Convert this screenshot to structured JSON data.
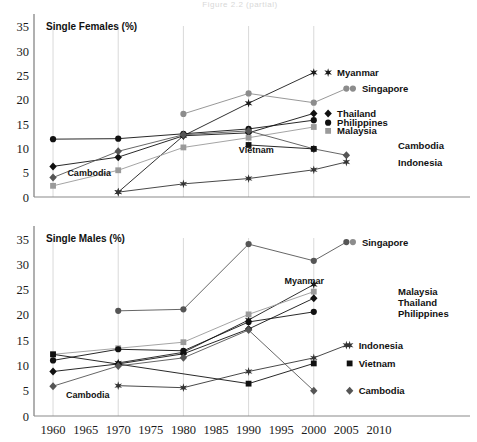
{
  "figure": {
    "faint_header": "Figure 2.2 (partial)",
    "background": "#ffffff",
    "ink": "#111111"
  },
  "panels": [
    {
      "id": "females",
      "title": "Single Females (%)"
    },
    {
      "id": "males",
      "title": "Single Males (%)"
    }
  ],
  "axis": {
    "x_ticks": [
      "1960",
      "1965",
      "1970",
      "1975",
      "1980",
      "1985",
      "1990",
      "1995",
      "2000",
      "2005",
      "2010"
    ],
    "y_ticks": [
      "0",
      "5",
      "10",
      "15",
      "20",
      "25",
      "30",
      "35"
    ],
    "xlim": [
      1958,
      2012
    ],
    "ylim": [
      0,
      36
    ],
    "grid": "vertical gridlines at 1960,1970,1980,1990,2000"
  },
  "inner_annotations": {
    "females": [
      {
        "text": "Cambodia",
        "x": 1962.2,
        "y": 4.3
      },
      {
        "text": "Vietnam",
        "x": 1988.5,
        "y": 9.0
      }
    ],
    "males": [
      {
        "text": "Cambodia",
        "x": 1962.0,
        "y": 3.6
      },
      {
        "text": "Myanmar",
        "x": 1995.5,
        "y": 26.2
      }
    ]
  },
  "series_colors": {
    "Myanmar": "#1a1a1a",
    "Singapore": "#8c8c8c",
    "Thailand": "#111111",
    "Philippines": "#111111",
    "Malaysia": "#9a9a9a",
    "Cambodia": "#555555",
    "Indonesia": "#333333",
    "Vietnam": "#111111"
  },
  "chart_data": [
    {
      "type": "line",
      "title": "Single Females (%)",
      "xlabel": "",
      "ylabel": "Single Females (%)",
      "xlim": [
        1958,
        2012
      ],
      "ylim": [
        0,
        36
      ],
      "x": [
        1960,
        1970,
        1980,
        1990,
        2000,
        2005
      ],
      "grid": "vertical only",
      "legend": "right-side series labels",
      "series": [
        {
          "name": "Myanmar",
          "marker": "star",
          "color": "#1a1a1a",
          "points": [
            [
              1970,
              1.0
            ],
            [
              1980,
              12.6
            ],
            [
              1990,
              19.3
            ],
            [
              2000,
              25.6
            ]
          ]
        },
        {
          "name": "Singapore",
          "marker": "circle",
          "color": "#8c8c8c",
          "points": [
            [
              1980,
              17.1
            ],
            [
              1990,
              21.3
            ],
            [
              2000,
              19.4
            ],
            [
              2005,
              22.3
            ]
          ]
        },
        {
          "name": "Thailand",
          "marker": "diamond",
          "color": "#111111",
          "points": [
            [
              1960,
              6.3
            ],
            [
              1970,
              8.2
            ],
            [
              1980,
              12.6
            ],
            [
              1990,
              13.2
            ],
            [
              2000,
              17.2
            ]
          ]
        },
        {
          "name": "Philippines",
          "marker": "circle",
          "color": "#111111",
          "points": [
            [
              1960,
              11.9
            ],
            [
              1970,
              12.0
            ],
            [
              1980,
              13.0
            ],
            [
              1990,
              14.0
            ],
            [
              2000,
              15.8
            ]
          ]
        },
        {
          "name": "Malaysia",
          "marker": "square",
          "color": "#9a9a9a",
          "points": [
            [
              1960,
              2.3
            ],
            [
              1970,
              5.5
            ],
            [
              1980,
              10.2
            ],
            [
              1990,
              12.2
            ],
            [
              2000,
              14.4
            ]
          ]
        },
        {
          "name": "Cambodia",
          "marker": "diamond",
          "color": "#555555",
          "points": [
            [
              1960,
              4.0
            ],
            [
              1970,
              9.4
            ],
            [
              1980,
              12.8
            ],
            [
              1990,
              13.6
            ],
            [
              2000,
              9.9
            ],
            [
              2005,
              8.6
            ]
          ]
        },
        {
          "name": "Indonesia",
          "marker": "star",
          "color": "#333333",
          "points": [
            [
              1970,
              1.0
            ],
            [
              1980,
              2.7
            ],
            [
              1990,
              3.8
            ],
            [
              2000,
              5.6
            ],
            [
              2005,
              7.2
            ]
          ]
        },
        {
          "name": "Vietnam",
          "marker": "square",
          "color": "#111111",
          "points": [
            [
              1990,
              10.7
            ],
            [
              2000,
              9.9
            ]
          ]
        }
      ],
      "right_labels": [
        {
          "name": "Myanmar",
          "y": 25.6,
          "marker": "star",
          "x_marker": 2002.2
        },
        {
          "name": "Singapore",
          "y": 22.3,
          "marker": "circle",
          "x_marker": 2006.0
        },
        {
          "name": "Thailand",
          "y": 17.2,
          "marker": "diamond",
          "x_marker": 2002.2
        },
        {
          "name": "Philippines",
          "y": 15.3,
          "marker": "circle",
          "x_marker": 2002.2
        },
        {
          "name": "Malaysia",
          "y": 13.6,
          "marker": "square",
          "x_marker": 2002.2
        },
        {
          "name": "Cambodia",
          "y": 10.6,
          "marker": "none",
          "x_marker": null
        },
        {
          "name": "Indonesia",
          "y": 7.2,
          "marker": "none",
          "x_marker": null
        }
      ]
    },
    {
      "type": "line",
      "title": "Single Males (%)",
      "xlabel": "",
      "ylabel": "Single Males (%)",
      "xlim": [
        1958,
        2012
      ],
      "ylim": [
        0,
        36
      ],
      "x": [
        1960,
        1970,
        1980,
        1990,
        2000,
        2005
      ],
      "grid": "vertical only",
      "legend": "right-side series labels",
      "series": [
        {
          "name": "Singapore",
          "marker": "circle",
          "color": "#555555",
          "points": [
            [
              1970,
              20.8
            ],
            [
              1980,
              21.1
            ],
            [
              1990,
              34.0
            ],
            [
              2000,
              30.7
            ],
            [
              2005,
              34.4
            ]
          ]
        },
        {
          "name": "Myanmar",
          "marker": "star",
          "color": "#1a1a1a",
          "points": [
            [
              1970,
              10.5
            ],
            [
              1980,
              12.6
            ],
            [
              1990,
              19.0
            ],
            [
              2000,
              26.0
            ]
          ]
        },
        {
          "name": "Malaysia",
          "marker": "square",
          "color": "#9a9a9a",
          "points": [
            [
              1960,
              12.2
            ],
            [
              1970,
              13.4
            ],
            [
              1980,
              14.6
            ],
            [
              1990,
              20.1
            ],
            [
              2000,
              24.6
            ]
          ]
        },
        {
          "name": "Thailand",
          "marker": "diamond",
          "color": "#111111",
          "points": [
            [
              1960,
              8.8
            ],
            [
              1970,
              10.3
            ],
            [
              1980,
              12.3
            ],
            [
              1990,
              17.2
            ],
            [
              2000,
              23.3
            ]
          ]
        },
        {
          "name": "Philippines",
          "marker": "circle",
          "color": "#111111",
          "points": [
            [
              1960,
              11.0
            ],
            [
              1970,
              13.2
            ],
            [
              1980,
              12.9
            ],
            [
              1990,
              18.6
            ],
            [
              2000,
              20.6
            ]
          ]
        },
        {
          "name": "Indonesia",
          "marker": "star",
          "color": "#333333",
          "points": [
            [
              1970,
              6.0
            ],
            [
              1980,
              5.6
            ],
            [
              1990,
              8.8
            ],
            [
              2000,
              11.5
            ],
            [
              2005,
              14.0
            ]
          ]
        },
        {
          "name": "Vietnam",
          "marker": "square",
          "color": "#111111",
          "points": [
            [
              1960,
              12.2
            ],
            [
              1990,
              6.4
            ],
            [
              2000,
              10.4
            ]
          ]
        },
        {
          "name": "Cambodia",
          "marker": "diamond",
          "color": "#555555",
          "points": [
            [
              1960,
              5.9
            ],
            [
              1970,
              9.9
            ],
            [
              1980,
              11.5
            ],
            [
              1990,
              17.0
            ],
            [
              2000,
              5.0
            ]
          ]
        }
      ],
      "right_labels": [
        {
          "name": "Singapore",
          "y": 34.4,
          "marker": "circle",
          "x_marker": 2006.0
        },
        {
          "name": "Malaysia",
          "y": 24.6,
          "marker": "none",
          "x_marker": null
        },
        {
          "name": "Thailand",
          "y": 22.4,
          "marker": "none",
          "x_marker": null
        },
        {
          "name": "Philippines",
          "y": 20.2,
          "marker": "none",
          "x_marker": null
        },
        {
          "name": "Indonesia",
          "y": 14.0,
          "marker": "star",
          "x_marker": 2005.5
        },
        {
          "name": "Vietnam",
          "y": 10.4,
          "marker": "square",
          "x_marker": 2005.5
        },
        {
          "name": "Cambodia",
          "y": 5.0,
          "marker": "diamond",
          "x_marker": 2005.5
        }
      ]
    }
  ]
}
